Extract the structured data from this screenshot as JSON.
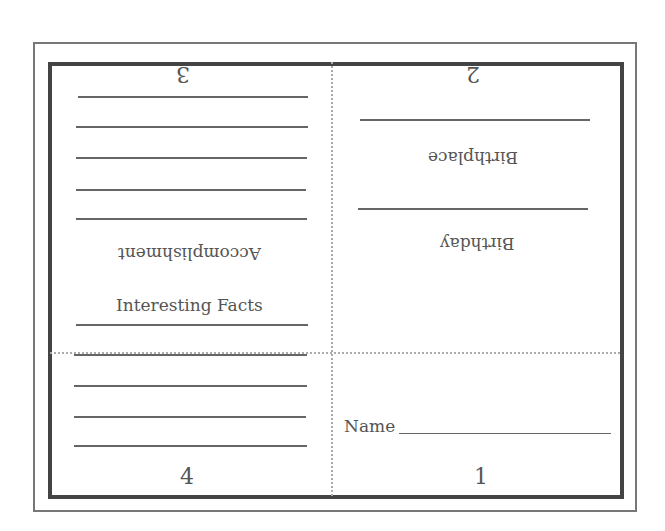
{
  "booklet": {
    "panels": {
      "page1": {
        "number": "1",
        "name_label": "Name"
      },
      "page2": {
        "number": "2",
        "labels": [
          "Birthplace",
          "Birthday"
        ]
      },
      "page3": {
        "number": "3",
        "label": "Accomplishment",
        "line_count": 5
      },
      "page4": {
        "number": "4",
        "label": "Interesting Facts",
        "line_count": 5
      }
    }
  }
}
